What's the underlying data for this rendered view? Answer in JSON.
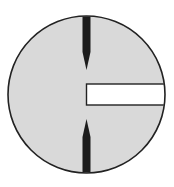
{
  "diagram": {
    "type": "reticle",
    "canvas": {
      "width": 174,
      "height": 187,
      "background": "#ffffff"
    },
    "circle": {
      "cx": 86.5,
      "cy": 94.5,
      "r": 78.5,
      "fill": "#d9d9d9",
      "stroke": "#222222",
      "stroke_width": 1.6
    },
    "top_pointer": {
      "x_left": 82.5,
      "x_right": 90.5,
      "y_start": 14,
      "y_shoulder": 52,
      "y_tip": 70,
      "fill": "#1c1c1c"
    },
    "bottom_pointer": {
      "x_left": 82.5,
      "x_right": 90.5,
      "y_end": 175,
      "y_shoulder": 137,
      "y_tip": 119,
      "fill": "#1c1c1c"
    },
    "slot_rect": {
      "x": 86.5,
      "y": 84,
      "width": 78,
      "height": 21,
      "fill": "#ffffff",
      "stroke": "#222222",
      "stroke_width": 1.4
    }
  }
}
